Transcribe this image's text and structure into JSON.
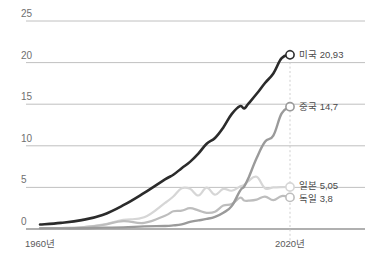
{
  "chart_data": {
    "type": "line",
    "title": "",
    "subtitle": "",
    "xlabel": "",
    "ylabel": "",
    "xlim": [
      1960,
      2020
    ],
    "ylim": [
      0,
      25
    ],
    "grid": true,
    "grid_axis": "y",
    "legend_position": "right-inline-at-line-end",
    "y_ticks": [
      "0",
      "5",
      "10",
      "15",
      "20",
      "25"
    ],
    "y_tick_values": [
      0,
      5,
      10,
      15,
      20,
      25
    ],
    "x_ticks": [
      "1960년",
      "2020년"
    ],
    "x_tick_values": [
      1960,
      2020
    ],
    "decimal_separator": ",",
    "annotations": {
      "vertical_marker_year": 2020,
      "vertical_marker_style": "dotted"
    },
    "x": [
      1960,
      1965,
      1970,
      1975,
      1980,
      1985,
      1990,
      1992,
      1994,
      1996,
      1998,
      2000,
      2002,
      2004,
      2006,
      2008,
      2009,
      2010,
      2012,
      2014,
      2016,
      2018,
      2020
    ],
    "series": [
      {
        "name": "미국",
        "label": "미국 20,93",
        "end_value": 20.93,
        "end_value_text": "20,93",
        "color": "#2b2b2b",
        "values": [
          0.54,
          0.74,
          1.07,
          1.69,
          2.86,
          4.34,
          5.96,
          6.52,
          7.31,
          8.07,
          9.06,
          10.25,
          10.94,
          12.21,
          13.81,
          14.77,
          14.48,
          15.05,
          16.25,
          17.55,
          18.7,
          20.53,
          20.93
        ]
      },
      {
        "name": "중국",
        "label": "중국 14,7",
        "end_value": 14.7,
        "end_value_text": "14,7",
        "color": "#9a9a9a",
        "values": [
          0.06,
          0.07,
          0.09,
          0.16,
          0.19,
          0.31,
          0.36,
          0.43,
          0.56,
          0.86,
          1.03,
          1.21,
          1.47,
          1.96,
          2.75,
          4.59,
          5.11,
          6.09,
          8.53,
          10.48,
          11.23,
          13.89,
          14.7
        ]
      },
      {
        "name": "일본",
        "label": "일본 5,05",
        "end_value": 5.05,
        "end_value_text": "5,05",
        "color": "#d6d6d6",
        "values": [
          0.04,
          0.09,
          0.21,
          0.52,
          1.11,
          1.4,
          3.13,
          3.91,
          4.9,
          4.83,
          4.03,
          4.97,
          4.12,
          4.82,
          4.6,
          5.11,
          5.29,
          5.76,
          6.27,
          4.9,
          5.0,
          5.04,
          5.05
        ]
      },
      {
        "name": "독일",
        "label": "독일 3,8",
        "end_value": 3.8,
        "end_value_text": "3,8",
        "color": "#bdbdbd",
        "values": [
          0.09,
          0.12,
          0.21,
          0.48,
          0.95,
          0.73,
          1.6,
          2.13,
          2.21,
          2.5,
          2.24,
          1.95,
          2.08,
          2.82,
          3.0,
          3.75,
          3.42,
          3.4,
          3.53,
          3.9,
          3.47,
          3.96,
          3.8
        ]
      }
    ]
  },
  "axes": {
    "y_axis_name": "y-axis",
    "x_axis_name": "x-axis"
  }
}
